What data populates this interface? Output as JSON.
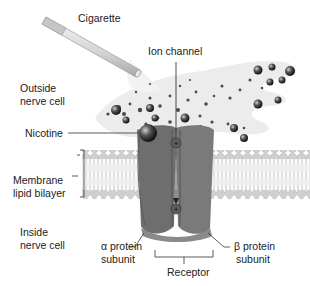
{
  "diagram": {
    "labels": {
      "cigarette": "Cigarette",
      "ion_channel": "Ion channel",
      "outside_1": "Outside",
      "outside_2": "nerve cell",
      "nicotine": "Nicotine",
      "membrane_1": "Membrane",
      "membrane_2": "lipid bilayer",
      "inside_1": "Inside",
      "inside_2": "nerve cell",
      "alpha_1": "α protein",
      "alpha_2": "subunit",
      "beta_1": "β protein",
      "beta_2": "subunit",
      "receptor": "Receptor"
    },
    "ion_symbol": "+",
    "colors": {
      "receptor": "#6e6e6e",
      "receptor_light": "#8a8a8a",
      "membrane_head": "#cfcfcf",
      "membrane_tail": "#e2e2e2",
      "smoke": "#e9e9e9",
      "particle": "#3a3a3a",
      "line": "#333333"
    }
  }
}
